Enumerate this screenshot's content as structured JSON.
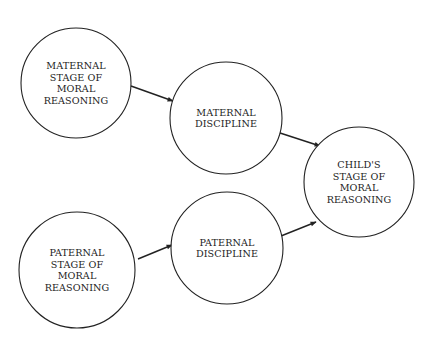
{
  "diagram": {
    "type": "path-diagram",
    "colors": {
      "stroke": "#222222",
      "background": "#ffffff",
      "text": "#222222"
    },
    "nodes": [
      {
        "id": "maternal_stage",
        "cx": 76,
        "cy": 83,
        "r": 55,
        "lines": [
          "MATERNAL",
          "STAGE OF",
          "MORAL",
          "REASONING"
        ]
      },
      {
        "id": "maternal_discipline",
        "cx": 226,
        "cy": 118,
        "r": 56,
        "lines": [
          "MATERNAL",
          "DISCIPLINE"
        ]
      },
      {
        "id": "childs_stage",
        "cx": 359,
        "cy": 182,
        "r": 55,
        "lines": [
          "CHILD'S",
          "STAGE OF",
          "MORAL",
          "REASONING"
        ]
      },
      {
        "id": "paternal_stage",
        "cx": 77,
        "cy": 270,
        "r": 58,
        "lines": [
          "PATERNAL",
          "STAGE OF",
          "MORAL",
          "REASONING"
        ]
      },
      {
        "id": "paternal_discipline",
        "cx": 227,
        "cy": 248,
        "r": 56,
        "lines": [
          "PATERNAL",
          "DISCIPLINE"
        ]
      }
    ],
    "edges": [
      {
        "from": "maternal_stage",
        "to": "maternal_discipline",
        "x1": 131,
        "y1": 86,
        "x2": 173,
        "y2": 101
      },
      {
        "from": "maternal_discipline",
        "to": "childs_stage",
        "x1": 277,
        "y1": 132,
        "x2": 320,
        "y2": 146
      },
      {
        "from": "paternal_stage",
        "to": "paternal_discipline",
        "x1": 138,
        "y1": 259,
        "x2": 172,
        "y2": 245
      },
      {
        "from": "paternal_discipline",
        "to": "childs_stage",
        "x1": 281,
        "y1": 236,
        "x2": 316,
        "y2": 222
      }
    ]
  }
}
